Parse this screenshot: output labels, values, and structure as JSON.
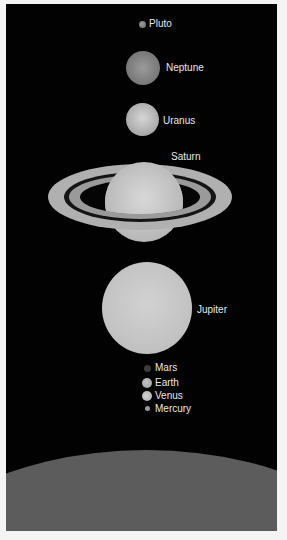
{
  "background_color": "#020202",
  "label_color": "#e8e8e8",
  "planets": {
    "pluto": {
      "label": "Pluto"
    },
    "neptune": {
      "label": "Neptune"
    },
    "uranus": {
      "label": "Uranus"
    },
    "saturn": {
      "label": "Saturn"
    },
    "jupiter": {
      "label": "Jupiter"
    },
    "mars": {
      "label": "Mars"
    },
    "earth": {
      "label": "Earth"
    },
    "venus": {
      "label": "Venus"
    },
    "mercury": {
      "label": "Mercury"
    }
  },
  "surface": {
    "label": "Sun surface (partial)"
  }
}
